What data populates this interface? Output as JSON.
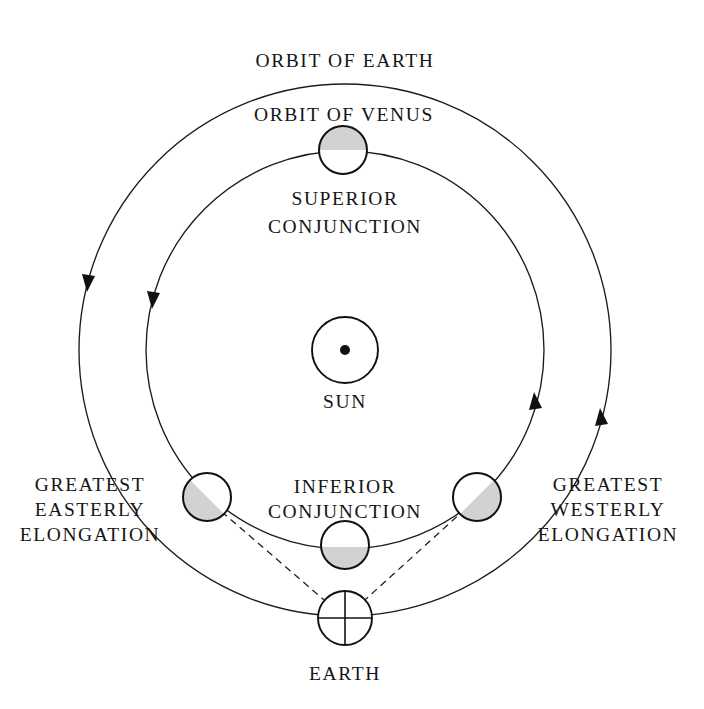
{
  "diagram": {
    "type": "astronomical-orbit-diagram",
    "background_color": "#ffffff",
    "line_color": "#1c1c1c",
    "shadow_fill": "#d2d2d2",
    "lit_fill": "#ffffff",
    "labels": {
      "orbit_of_earth": "ORBIT OF EARTH",
      "orbit_of_venus": "ORBIT OF VENUS",
      "superior_conjunction_line1": "SUPERIOR",
      "superior_conjunction_line2": "CONJUNCTION",
      "sun": "SUN",
      "greatest_easterly_line1": "GREATEST",
      "greatest_easterly_line2": "EASTERLY",
      "greatest_easterly_line3": "ELONGATION",
      "greatest_westerly_line1": "GREATEST",
      "greatest_westerly_line2": "WESTERLY",
      "greatest_westerly_line3": "ELONGATION",
      "inferior_conjunction_line1": "INFERIOR",
      "inferior_conjunction_line2": "CONJUNCTION",
      "earth": "EARTH"
    },
    "geometry": {
      "sun_center_x": 345,
      "sun_center_y": 350,
      "sun_radius": 33,
      "sun_dot_radius": 5,
      "earth_orbit_radius": 266,
      "venus_orbit_radius": 199,
      "earth_symbol_x": 345,
      "earth_symbol_y": 618,
      "earth_symbol_radius": 27,
      "venus_body_radius": 24
    },
    "bodies": [
      {
        "name": "venus-superior-conjunction",
        "cx": 343,
        "cy": 150,
        "r": 24,
        "shadow_side": "top"
      },
      {
        "name": "venus-greatest-easterly-elongation",
        "cx": 207,
        "cy": 497,
        "r": 24,
        "shadow_side": "lower-left"
      },
      {
        "name": "venus-greatest-westerly-elongation",
        "cx": 477,
        "cy": 497,
        "r": 24,
        "shadow_side": "lower-right"
      },
      {
        "name": "venus-inferior-conjunction",
        "cx": 345,
        "cy": 545,
        "r": 24,
        "shadow_side": "bottom"
      }
    ],
    "arrows": [
      {
        "name": "earth-orbit-arrow-left",
        "x": 88,
        "y": 281,
        "direction": "down"
      },
      {
        "name": "venus-orbit-arrow-left",
        "x": 153,
        "y": 298,
        "direction": "down"
      },
      {
        "name": "venus-orbit-arrow-right",
        "x": 535,
        "y": 404,
        "direction": "up"
      },
      {
        "name": "earth-orbit-arrow-right",
        "x": 601,
        "y": 420,
        "direction": "up"
      }
    ],
    "sight_lines": [
      {
        "name": "sight-line-easterly",
        "x1": 345,
        "y1": 618,
        "x2": 222,
        "y2": 512
      },
      {
        "name": "sight-line-westerly",
        "x1": 345,
        "y1": 618,
        "x2": 462,
        "y2": 512
      }
    ],
    "motion_direction": "counterclockwise"
  }
}
